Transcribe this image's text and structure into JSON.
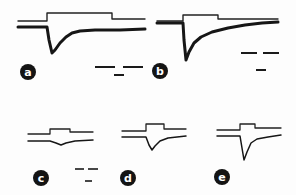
{
  "chart_data": {
    "type": "line",
    "title": "",
    "axes": "none (scale bars only, unlabeled)",
    "grid": false,
    "legend": "none",
    "panels": [
      {
        "label": "a",
        "label_pos": [
          28,
          72
        ],
        "top_trace": [
          [
            18,
            21
          ],
          [
            47,
            21
          ],
          [
            47,
            13
          ],
          [
            112,
            13
          ],
          [
            112,
            19
          ],
          [
            145,
            19
          ]
        ],
        "bottom_trace": [
          [
            18,
            27
          ],
          [
            47,
            27
          ],
          [
            49,
            40
          ],
          [
            52,
            53
          ],
          [
            55,
            50
          ],
          [
            60,
            43
          ],
          [
            66,
            37
          ],
          [
            72,
            33
          ],
          [
            80,
            31
          ],
          [
            95,
            30
          ],
          [
            120,
            30
          ],
          [
            145,
            29
          ]
        ],
        "bottom_width": 3,
        "scale_bars": [
          [
            95,
            67,
            115,
            67
          ],
          [
            123,
            67,
            143,
            67
          ],
          [
            114,
            75,
            124,
            75
          ]
        ]
      },
      {
        "label": "b",
        "label_pos": [
          160,
          71
        ],
        "top_trace": [
          [
            157,
            21
          ],
          [
            183,
            21
          ],
          [
            183,
            15
          ],
          [
            218,
            15
          ],
          [
            218,
            19
          ],
          [
            278,
            19
          ]
        ],
        "bottom_trace": [
          [
            157,
            23
          ],
          [
            183,
            23
          ],
          [
            184,
            40
          ],
          [
            186,
            60
          ],
          [
            189,
            52
          ],
          [
            194,
            43
          ],
          [
            201,
            37
          ],
          [
            212,
            32
          ],
          [
            228,
            28
          ],
          [
            245,
            25
          ],
          [
            262,
            23
          ],
          [
            278,
            22
          ]
        ],
        "bottom_width": 3,
        "scale_bars": [
          [
            241,
            53,
            257,
            53
          ],
          [
            263,
            53,
            279,
            53
          ],
          [
            256,
            70,
            266,
            70
          ]
        ]
      },
      {
        "label": "c",
        "label_pos": [
          41,
          178
        ],
        "top_trace": [
          [
            28,
            134
          ],
          [
            50,
            134
          ],
          [
            50,
            129
          ],
          [
            70,
            129
          ],
          [
            70,
            132
          ],
          [
            93,
            132
          ]
        ],
        "bottom_trace": [
          [
            28,
            141
          ],
          [
            50,
            141
          ],
          [
            56,
            143
          ],
          [
            61,
            145
          ],
          [
            66,
            143
          ],
          [
            75,
            141
          ],
          [
            93,
            140
          ]
        ],
        "bottom_width": 1.5,
        "scale_bars": [
          [
            75,
            169,
            84,
            169
          ],
          [
            88,
            169,
            98,
            169
          ],
          [
            85,
            181,
            92,
            181
          ]
        ]
      },
      {
        "label": "d",
        "label_pos": [
          128,
          178
        ],
        "top_trace": [
          [
            122,
            131
          ],
          [
            146,
            131
          ],
          [
            146,
            124
          ],
          [
            164,
            124
          ],
          [
            164,
            129
          ],
          [
            186,
            129
          ]
        ],
        "bottom_trace": [
          [
            122,
            137
          ],
          [
            146,
            137
          ],
          [
            149,
            145
          ],
          [
            152,
            150
          ],
          [
            155,
            146
          ],
          [
            160,
            141
          ],
          [
            168,
            138
          ],
          [
            186,
            136
          ]
        ],
        "bottom_width": 1.5,
        "scale_bars": []
      },
      {
        "label": "e",
        "label_pos": [
          222,
          177
        ],
        "top_trace": [
          [
            217,
            130
          ],
          [
            240,
            130
          ],
          [
            240,
            124
          ],
          [
            255,
            124
          ],
          [
            255,
            128
          ],
          [
            281,
            128
          ]
        ],
        "bottom_trace": [
          [
            217,
            136
          ],
          [
            240,
            136
          ],
          [
            242,
            148
          ],
          [
            244,
            160
          ],
          [
            247,
            152
          ],
          [
            251,
            143
          ],
          [
            257,
            139
          ],
          [
            268,
            137
          ],
          [
            281,
            135
          ]
        ],
        "bottom_width": 1.5,
        "scale_bars": []
      }
    ]
  },
  "labels": {
    "a": "a",
    "b": "b",
    "c": "c",
    "d": "d",
    "e": "e"
  }
}
